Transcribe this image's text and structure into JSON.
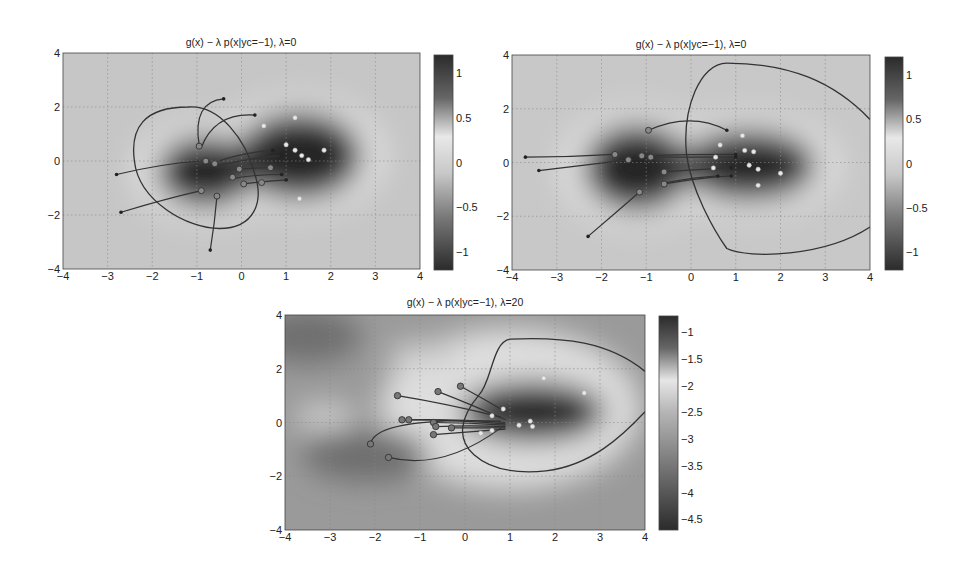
{
  "chart_data": [
    {
      "type": "heatmap",
      "title": "g(x) − λ p(x|yc=−1), λ=0",
      "xlabel": "",
      "ylabel": "",
      "xlim": [
        -4,
        4
      ],
      "ylim": [
        -4,
        4
      ],
      "xticks": [
        "−4",
        "−3",
        "−2",
        "−1",
        "0",
        "1",
        "2",
        "3",
        "4"
      ],
      "yticks": [
        "4",
        "2",
        "0",
        "−2",
        "−4"
      ],
      "grid": true,
      "colorbar": {
        "ticks": [
          "1",
          "0.5",
          "0",
          "−0.5",
          "−1"
        ],
        "range": [
          -1.2,
          1.2
        ]
      },
      "blobs": [
        {
          "cx": -0.8,
          "cy": -0.4,
          "rx": 1.1,
          "ry": 1.3,
          "value": -1.0
        },
        {
          "cx": 1.3,
          "cy": 0.2,
          "rx": 1.4,
          "ry": 1.6,
          "value": 1.1
        }
      ],
      "decision_boundary": "M -1.2 2 C -2.2 2 -2.5 1.2 -2.4 0 C -2.3 -1.5 -1.2 -2.5 -0.5 -2.5 C 0.3 -2.5 0.5 -1.5 0.3 -0.5 C 0.1 0.8 -0.5 2.1 -1.2 2 Z",
      "targets": [
        [
          1.2,
          1.6
        ],
        [
          0.5,
          1.3
        ],
        [
          1.0,
          0.6
        ],
        [
          1.2,
          0.4
        ],
        [
          1.35,
          0.2
        ],
        [
          1.85,
          0.4
        ],
        [
          1.5,
          0.05
        ],
        [
          1.3,
          -1.4
        ]
      ],
      "trajectories": [
        {
          "start": [
            -0.4,
            2.3
          ],
          "end": [
            -0.95,
            0.6
          ],
          "ctrl": [
            -1.1,
            2.2
          ]
        },
        {
          "start": [
            0.3,
            1.7
          ],
          "end": [
            -0.9,
            0.5
          ],
          "ctrl": [
            -0.6,
            1.8
          ]
        },
        {
          "start": [
            -2.8,
            -0.5
          ],
          "end": [
            -0.9,
            0.0
          ],
          "ctrl": [
            -1.8,
            -0.1
          ]
        },
        {
          "start": [
            -2.7,
            -1.9
          ],
          "end": [
            -0.9,
            -1.1
          ],
          "ctrl": [
            -1.7,
            -1.4
          ]
        },
        {
          "start": [
            -0.7,
            -3.3
          ],
          "end": [
            -0.55,
            -1.3
          ],
          "ctrl": [
            -0.6,
            -2.3
          ]
        },
        {
          "start": [
            0.7,
            0.4
          ],
          "end": [
            -0.5,
            0.0
          ],
          "ctrl": [
            0.0,
            0.3
          ]
        },
        {
          "start": [
            0.9,
            0.2
          ],
          "end": [
            -0.6,
            -0.2
          ],
          "ctrl": [
            0.1,
            0.1
          ]
        },
        {
          "start": [
            0.7,
            -0.25
          ],
          "end": [
            -0.05,
            -0.3
          ],
          "ctrl": [
            0.3,
            -0.25
          ]
        },
        {
          "start": [
            0.9,
            -0.5
          ],
          "end": [
            -0.2,
            -0.65
          ],
          "ctrl": [
            0.3,
            -0.5
          ]
        },
        {
          "start": [
            1.0,
            -0.7
          ],
          "end": [
            0.05,
            -0.85
          ],
          "ctrl": [
            0.5,
            -0.75
          ]
        }
      ],
      "mid_points": [
        [
          -0.8,
          0.0
        ],
        [
          -0.6,
          -0.1
        ],
        [
          -0.05,
          -0.3
        ],
        [
          -0.2,
          -0.6
        ],
        [
          0.05,
          -0.85
        ],
        [
          0.45,
          -0.8
        ],
        [
          -0.9,
          -1.1
        ],
        [
          -0.55,
          -1.3
        ],
        [
          0.65,
          -0.25
        ],
        [
          -0.95,
          0.55
        ]
      ]
    },
    {
      "type": "heatmap",
      "title": "g(x) − λ p(x|yc=−1), λ=0",
      "xlim": [
        -4,
        4
      ],
      "ylim": [
        -4,
        4
      ],
      "xticks": [
        "−4",
        "−3",
        "−2",
        "−1",
        "0",
        "1",
        "2",
        "3",
        "4"
      ],
      "yticks": [
        "4",
        "2",
        "0",
        "−2",
        "−4"
      ],
      "grid": true,
      "colorbar": {
        "ticks": [
          "1",
          "0.5",
          "0",
          "−0.5",
          "−1"
        ],
        "range": [
          -1.2,
          1.2
        ]
      },
      "blobs": [
        {
          "cx": -1.2,
          "cy": -0.2,
          "rx": 1.2,
          "ry": 1.6,
          "value": 1.0
        },
        {
          "cx": 1.3,
          "cy": -0.1,
          "rx": 1.5,
          "ry": 1.3,
          "value": 1.0
        }
      ],
      "decision_boundary": "M 4 1.6 C 3.2 3.0 2.2 3.7 0.8 3.7 C 0.2 3.7 -0.2 2.0 -0.1 0.3 C 0 -1.0 0.5 -2.5 0.8 -3.2 C 1.3 -3.6 3.0 -3.5 4 -2.4",
      "targets": [
        [
          1.15,
          1.0
        ],
        [
          0.65,
          0.65
        ],
        [
          1.2,
          0.45
        ],
        [
          1.4,
          0.4
        ],
        [
          0.55,
          0.2
        ],
        [
          1.3,
          -0.1
        ],
        [
          1.5,
          -0.25
        ],
        [
          2.0,
          -0.4
        ],
        [
          0.5,
          -0.2
        ],
        [
          1.5,
          -0.85
        ]
      ],
      "trajectories": [
        {
          "start": [
            -3.7,
            0.2
          ],
          "end": [
            -1.7,
            0.3
          ],
          "ctrl": [
            -2.7,
            0.2
          ]
        },
        {
          "start": [
            -3.4,
            -0.3
          ],
          "end": [
            -1.4,
            0.1
          ],
          "ctrl": [
            -2.4,
            -0.1
          ]
        },
        {
          "start": [
            -2.3,
            -2.75
          ],
          "end": [
            -1.15,
            -1.1
          ],
          "ctrl": [
            -1.7,
            -1.9
          ]
        },
        {
          "start": [
            0.8,
            1.2
          ],
          "end": [
            -0.95,
            1.2
          ],
          "ctrl": [
            0,
            1.9
          ]
        },
        {
          "start": [
            1.0,
            0.3
          ],
          "end": [
            -1.1,
            0.25
          ],
          "ctrl": [
            0,
            0.3
          ]
        },
        {
          "start": [
            1.0,
            0.2
          ],
          "end": [
            -0.9,
            0.2
          ],
          "ctrl": [
            0,
            0.2
          ]
        },
        {
          "start": [
            0.9,
            -0.2
          ],
          "end": [
            -0.6,
            -0.35
          ],
          "ctrl": [
            0.2,
            -0.25
          ]
        },
        {
          "start": [
            0.9,
            -0.5
          ],
          "end": [
            -0.6,
            -0.8
          ],
          "ctrl": [
            0.3,
            -0.55
          ]
        },
        {
          "start": [
            0.6,
            -0.5
          ],
          "end": [
            -0.55,
            -0.75
          ],
          "ctrl": [
            0.1,
            -0.55
          ]
        }
      ],
      "mid_points": [
        [
          -1.7,
          0.3
        ],
        [
          -1.4,
          0.1
        ],
        [
          -1.1,
          0.25
        ],
        [
          -0.9,
          0.2
        ],
        [
          -0.95,
          1.2
        ],
        [
          -0.6,
          -0.35
        ],
        [
          -0.6,
          -0.8
        ],
        [
          -1.15,
          -1.1
        ]
      ]
    },
    {
      "type": "heatmap",
      "title": "g(x) − λ p(x|yc=−1), λ=20",
      "xlim": [
        -4,
        4
      ],
      "ylim": [
        -4,
        4
      ],
      "xticks": [
        "−4",
        "−3",
        "−2",
        "−1",
        "0",
        "1",
        "2",
        "3",
        "4"
      ],
      "yticks": [
        "4",
        "2",
        "0",
        "−2",
        "−4"
      ],
      "grid": true,
      "colorbar": {
        "ticks": [
          "−1",
          "−1.5",
          "−2",
          "−2.5",
          "−3",
          "−3.5",
          "−4",
          "−4.5"
        ],
        "range": [
          -4.7,
          -0.7
        ]
      },
      "blobs": [
        {
          "cx": 1.5,
          "cy": 0.4,
          "rx": 1.6,
          "ry": 1.1,
          "value": -4.5
        },
        {
          "cx": -2.2,
          "cy": -1.2,
          "rx": 1.4,
          "ry": 1.0,
          "value": -3.3
        },
        {
          "cx": -3.5,
          "cy": 3.2,
          "rx": 1.2,
          "ry": 1.0,
          "value": -3.6
        }
      ],
      "decision_boundary": "M 4 1.9 C 3.2 3.0 2.2 3.2 1.0 3.1 C 0.6 3.0 0.6 1.5 0.3 1.0 C -0.1 0.2 -0.2 -0.6 0.2 -1.2 C 0.6 -1.8 1.2 -1.9 1.8 -1.8 C 2.8 -1.6 3.5 -0.5 4 0.4",
      "targets": [
        [
          1.75,
          1.65
        ],
        [
          2.65,
          1.1
        ],
        [
          0.85,
          0.5
        ],
        [
          0.6,
          0.25
        ],
        [
          1.45,
          0.05
        ],
        [
          1.2,
          -0.1
        ],
        [
          1.5,
          -0.15
        ],
        [
          0.6,
          -0.3
        ],
        [
          0.35,
          -0.4
        ]
      ],
      "trajectories": [
        {
          "start": [
            -1.5,
            1.0
          ],
          "end": [
            0.8,
            0.2
          ],
          "ctrl": [
            -0.4,
            0.7
          ]
        },
        {
          "start": [
            -0.6,
            1.15
          ],
          "end": [
            0.9,
            0.1
          ],
          "ctrl": [
            0.1,
            0.7
          ]
        },
        {
          "start": [
            -0.1,
            1.35
          ],
          "end": [
            0.9,
            0.4
          ],
          "ctrl": [
            0.4,
            0.9
          ]
        },
        {
          "start": [
            -1.4,
            0.1
          ],
          "end": [
            0.9,
            0.0
          ],
          "ctrl": [
            -0.3,
            0.15
          ]
        },
        {
          "start": [
            -1.25,
            0.1
          ],
          "end": [
            0.9,
            -0.05
          ],
          "ctrl": [
            -0.2,
            0.1
          ]
        },
        {
          "start": [
            -0.7,
            0.0
          ],
          "end": [
            0.9,
            -0.1
          ],
          "ctrl": [
            0.1,
            0.0
          ]
        },
        {
          "start": [
            -0.65,
            -0.15
          ],
          "end": [
            0.9,
            -0.15
          ],
          "ctrl": [
            0.1,
            -0.1
          ]
        },
        {
          "start": [
            -0.3,
            -0.2
          ],
          "end": [
            0.9,
            -0.2
          ],
          "ctrl": [
            0.3,
            -0.2
          ]
        },
        {
          "start": [
            -0.7,
            -0.45
          ],
          "end": [
            0.9,
            -0.25
          ],
          "ctrl": [
            0.1,
            -0.35
          ]
        },
        {
          "start": [
            -2.1,
            -0.8
          ],
          "end": [
            0.8,
            0.05
          ],
          "ctrl": [
            -2.0,
            0.2
          ]
        },
        {
          "start": [
            -1.7,
            -1.3
          ],
          "end": [
            0.8,
            -0.2
          ],
          "ctrl": [
            -0.5,
            -1.8
          ]
        }
      ],
      "mid_points": [
        [
          -1.5,
          1.0
        ],
        [
          -0.6,
          1.15
        ],
        [
          -0.1,
          1.35
        ],
        [
          -1.4,
          0.1
        ],
        [
          -1.25,
          0.1
        ],
        [
          -0.7,
          0.0
        ],
        [
          -0.65,
          -0.15
        ],
        [
          -0.3,
          -0.2
        ],
        [
          -0.7,
          -0.45
        ],
        [
          -2.1,
          -0.8
        ],
        [
          -1.7,
          -1.3
        ]
      ]
    }
  ],
  "panels": [
    {
      "title": "g(x) − λ p(x|yc=−1), λ=0"
    },
    {
      "title": "g(x) − λ p(x|yc=−1), λ=0"
    },
    {
      "title": "g(x) − λ p(x|yc=−1), λ=20"
    }
  ],
  "colors": {
    "background": "#c8c8c8",
    "dark": "#2a2a2a",
    "line": "#333333",
    "grid": "#9a9a9a"
  }
}
